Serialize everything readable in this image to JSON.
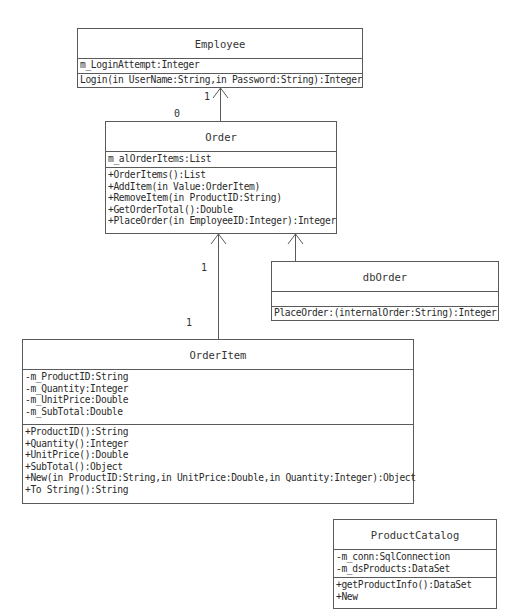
{
  "diagram": {
    "type": "UML class diagram",
    "classes": {
      "employee": {
        "name": "Employee",
        "attributes": [
          "m_LoginAttempt:Integer"
        ],
        "operations": [
          "Login(in UserName:String,in Password:String):Integer"
        ]
      },
      "order": {
        "name": "Order",
        "attributes": [
          "m_alOrderItems:List"
        ],
        "operations": [
          "+OrderItems():List",
          "+AddItem(in Value:OrderItem)",
          "+RemoveItem(in ProductID:String)",
          "+GetOrderTotal():Double",
          "+PlaceOrder(in EmployeeID:Integer):Integer"
        ]
      },
      "dborder": {
        "name": "dbOrder",
        "attributes": [],
        "operations": [
          "PlaceOrder:(internalOrder:String):Integer"
        ]
      },
      "orderitem": {
        "name": "OrderItem",
        "attributes": [
          "-m_ProductID:String",
          "-m_Quantity:Integer",
          "-m_UnitPrice:Double",
          "-m_SubTotal:Double"
        ],
        "operations": [
          "+ProductID():String",
          "+Quantity():Integer",
          "+UnitPrice():Double",
          "+SubTotal():Object",
          "+New(in ProductID:String,in UnitPrice:Double,in Quantity:Integer):Object",
          "+To String():String"
        ]
      },
      "productcatalog": {
        "name": "ProductCatalog",
        "attributes": [
          "-m_conn:SqlConnection",
          "-m_dsProducts:DataSet"
        ],
        "operations": [
          "+getProductInfo():DataSet",
          "+New"
        ]
      }
    },
    "associations": [
      {
        "from": "Order",
        "to": "Employee",
        "target_multiplicity": "1",
        "source_multiplicity": "0"
      },
      {
        "from": "OrderItem",
        "to": "Order",
        "target_multiplicity": "1",
        "source_multiplicity": "1"
      },
      {
        "from": "dbOrder",
        "to": "Order"
      }
    ],
    "colors": {
      "line": "#5a5a5a",
      "text": "#2a2a2a",
      "background": "#ffffff"
    }
  }
}
